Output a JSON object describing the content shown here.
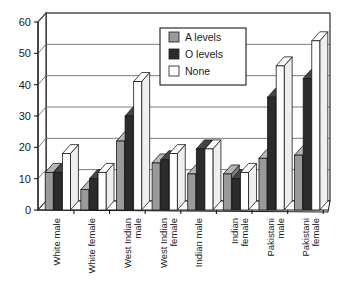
{
  "chart_data": {
    "type": "bar",
    "title": "",
    "subtitle": "",
    "xlabel": "",
    "ylabel": "",
    "ylim": [
      0,
      60
    ],
    "yticks": [
      0,
      10,
      20,
      30,
      40,
      50,
      60
    ],
    "ytick_labels": [
      "0",
      "10",
      "20",
      "30",
      "40",
      "50",
      "60"
    ],
    "grid": true,
    "legend_position": "top-center-right",
    "style": "3d-grouped-bars",
    "categories": [
      "White male",
      "White female",
      "West Indian male",
      "West Indian female",
      "Indian male",
      "Indian female",
      "Pakistani male",
      "Pakistani female"
    ],
    "series": [
      {
        "name": "A levels",
        "color": "#9a9a9a",
        "values": [
          12,
          6.5,
          22,
          15,
          11.5,
          11.5,
          16.5,
          17.5
        ]
      },
      {
        "name": "O levels",
        "color": "#2b2b2b",
        "values": [
          12,
          10,
          30,
          16,
          19.5,
          10,
          36,
          42
        ]
      },
      {
        "name": "None",
        "color": "#ffffff",
        "values": [
          18,
          12,
          41,
          18,
          19.5,
          12,
          46,
          54
        ]
      }
    ]
  },
  "legend": {
    "items": [
      {
        "label": "A levels",
        "color": "#9a9a9a"
      },
      {
        "label": "O levels",
        "color": "#2b2b2b"
      },
      {
        "label": "None",
        "color": "#ffffff"
      }
    ]
  },
  "axis": {
    "y_ticks": [
      "60",
      "50",
      "40",
      "30",
      "20",
      "10",
      "0"
    ]
  },
  "category_labels": [
    {
      "line1": "White male",
      "line2": ""
    },
    {
      "line1": "White female",
      "line2": ""
    },
    {
      "line1": "West Indian",
      "line2": "male"
    },
    {
      "line1": "West Indian",
      "line2": "female"
    },
    {
      "line1": "Indian male",
      "line2": ""
    },
    {
      "line1": "Indian",
      "line2": "female"
    },
    {
      "line1": "Pakistani",
      "line2": "male"
    },
    {
      "line1": "Pakistani",
      "line2": "female"
    }
  ]
}
